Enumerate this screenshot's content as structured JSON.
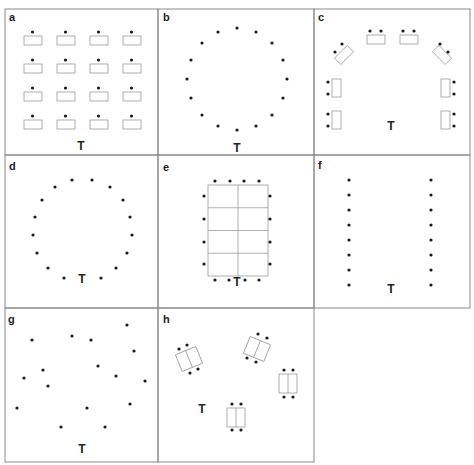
{
  "figure": {
    "type": "classroom-seating-arrangements",
    "teacher_marker": "T",
    "colors": {
      "frame": "#8a8a8a",
      "desk": "#9a9a9a",
      "seat": "#1a1a1a",
      "text": "#222222",
      "background": "#ffffff"
    },
    "panels": [
      {
        "id": "a",
        "label": "a",
        "description": "4x4 rows of single desks, each with one student facing teacher",
        "teacher": "T"
      },
      {
        "id": "b",
        "label": "b",
        "description": "16 students in a circle without desks, teacher below",
        "teacher": "T"
      },
      {
        "id": "c",
        "label": "c",
        "description": "Horseshoe of 8 paired desks with 16 students",
        "teacher": "T"
      },
      {
        "id": "d",
        "label": "d",
        "description": "Circle of 16 students with teacher inside the circle",
        "teacher": "T"
      },
      {
        "id": "e",
        "label": "e",
        "description": "Boardroom: one large table of 8 sections, students around it, teacher at end",
        "teacher": "T"
      },
      {
        "id": "f",
        "label": "f",
        "description": "Two parallel columns of 8 students facing each other",
        "teacher": "T"
      },
      {
        "id": "g",
        "label": "g",
        "description": "Students scattered randomly",
        "teacher": "T"
      },
      {
        "id": "h",
        "label": "h",
        "description": "Four clusters of paired desks, 4 students each, at varied angles",
        "teacher": "T"
      }
    ]
  }
}
